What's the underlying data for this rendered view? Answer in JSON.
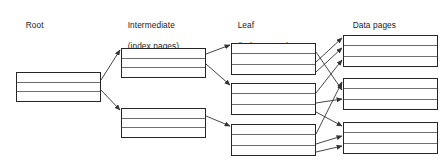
{
  "diagram": {
    "background_color": "#ffffff",
    "box_border_color": "#262626",
    "row_line_color": "#6e6e6e",
    "arrow_color": "#333333",
    "text_color": "#1b1b1b",
    "columns": [
      {
        "id": "root",
        "label_line1": "Root",
        "label_line2": "",
        "label_x": 16,
        "label_y": 9,
        "boxes": [
          {
            "id": "root-page-1",
            "x": 16,
            "y": 72,
            "w": 85,
            "h": 30,
            "rows": 3
          }
        ]
      },
      {
        "id": "intermediate",
        "label_line1": "Intermediate",
        "label_line2": "(index pages)",
        "label_x": 118,
        "label_y": 9,
        "boxes": [
          {
            "id": "intermediate-page-1",
            "x": 121,
            "y": 48,
            "w": 85,
            "h": 30,
            "rows": 3
          },
          {
            "id": "intermediate-page-2",
            "x": 121,
            "y": 108,
            "w": 85,
            "h": 30,
            "rows": 3
          }
        ]
      },
      {
        "id": "leaf",
        "label_line1": "Leaf",
        "label_line2": "(index pages)",
        "label_x": 228,
        "label_y": 9,
        "boxes": [
          {
            "id": "leaf-page-1",
            "x": 231,
            "y": 43,
            "w": 85,
            "h": 32,
            "rows": 3
          },
          {
            "id": "leaf-page-2",
            "x": 231,
            "y": 83,
            "w": 85,
            "h": 32,
            "rows": 3
          },
          {
            "id": "leaf-page-3",
            "x": 231,
            "y": 124,
            "w": 85,
            "h": 32,
            "rows": 3
          }
        ]
      },
      {
        "id": "data",
        "label_line1": "Data pages",
        "label_line2": "",
        "label_x": 343,
        "label_y": 9,
        "boxes": [
          {
            "id": "data-page-1",
            "x": 343,
            "y": 35,
            "w": 95,
            "h": 32,
            "rows": 3
          },
          {
            "id": "data-page-2",
            "x": 343,
            "y": 78,
            "w": 95,
            "h": 32,
            "rows": 3
          },
          {
            "id": "data-page-3",
            "x": 343,
            "y": 122,
            "w": 95,
            "h": 32,
            "rows": 3
          }
        ]
      }
    ],
    "links": [
      {
        "id": "root-to-intermediate-1",
        "x1": 101,
        "y1": 80,
        "x2": 120,
        "y2": 50
      },
      {
        "id": "root-to-intermediate-2",
        "x1": 101,
        "y1": 90,
        "x2": 120,
        "y2": 110
      },
      {
        "id": "intermediate-1-to-leaf-1",
        "x1": 206,
        "y1": 54,
        "x2": 230,
        "y2": 45
      },
      {
        "id": "intermediate-1-to-leaf-2",
        "x1": 206,
        "y1": 64,
        "x2": 230,
        "y2": 85
      },
      {
        "id": "intermediate-2-to-leaf-3",
        "x1": 206,
        "y1": 116,
        "x2": 230,
        "y2": 126
      },
      {
        "id": "leaf-1-to-data-1-row1",
        "x1": 316,
        "y1": 62,
        "x2": 342,
        "y2": 38
      },
      {
        "id": "leaf-1-to-data-1-row2",
        "x1": 316,
        "y1": 72,
        "x2": 342,
        "y2": 48
      },
      {
        "id": "leaf-1-to-data-2-row1",
        "x1": 316,
        "y1": 52,
        "x2": 342,
        "y2": 90
      },
      {
        "id": "leaf-2-to-data-1-row3",
        "x1": 316,
        "y1": 93,
        "x2": 342,
        "y2": 60
      },
      {
        "id": "leaf-2-to-data-2-row2",
        "x1": 316,
        "y1": 103,
        "x2": 342,
        "y2": 99
      },
      {
        "id": "leaf-2-to-data-3-row1",
        "x1": 316,
        "y1": 112,
        "x2": 342,
        "y2": 126
      },
      {
        "id": "leaf-3-to-data-2-row3",
        "x1": 316,
        "y1": 134,
        "x2": 342,
        "y2": 82
      },
      {
        "id": "leaf-3-to-data-3-row2",
        "x1": 316,
        "y1": 144,
        "x2": 342,
        "y2": 136
      },
      {
        "id": "leaf-3-to-data-3-row3",
        "x1": 316,
        "y1": 152,
        "x2": 342,
        "y2": 146
      }
    ]
  }
}
